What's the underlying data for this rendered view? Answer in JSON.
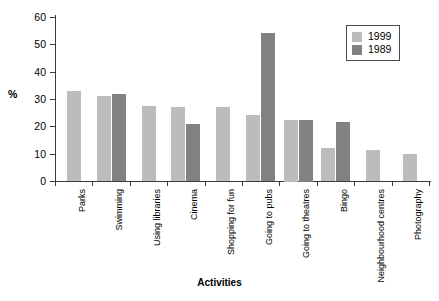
{
  "chart_data": {
    "type": "bar",
    "title": "",
    "xlabel": "Activities",
    "ylabel": "%",
    "ylim": [
      0,
      60
    ],
    "yticks": [
      0,
      10,
      20,
      30,
      40,
      50,
      60
    ],
    "grid": false,
    "legend_position": "top-right",
    "categories": [
      "Parks",
      "Swimming",
      "Using libraries",
      "Cinema",
      "Shopping for fun",
      "Going to pubs",
      "Going to theatres",
      "Bingo",
      "Neighbourhood centres",
      "Photography"
    ],
    "series": [
      {
        "name": "1999",
        "color": "#bcbcbc",
        "values": [
          33,
          31,
          27.5,
          27,
          27,
          24,
          22.5,
          12,
          11.5,
          10
        ]
      },
      {
        "name": "1989",
        "color": "#828282",
        "values": [
          null,
          32,
          null,
          21,
          null,
          54,
          22.5,
          21.5,
          null,
          null
        ]
      }
    ]
  },
  "legend": {
    "items": [
      {
        "label": "1999",
        "swatch": "light"
      },
      {
        "label": "1989",
        "swatch": "dark"
      }
    ]
  }
}
